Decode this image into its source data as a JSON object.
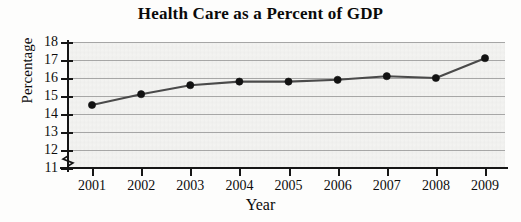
{
  "chart_data": {
    "type": "line",
    "title": "Health Care as a Percent of GDP",
    "xlabel": "Year",
    "ylabel": "Percentage",
    "categories": [
      "2001",
      "2002",
      "2003",
      "2004",
      "2005",
      "2006",
      "2007",
      "2008",
      "2009"
    ],
    "values": [
      14.5,
      15.1,
      15.6,
      15.8,
      15.8,
      15.9,
      16.1,
      16.0,
      17.1
    ],
    "x": [
      2001,
      2002,
      2003,
      2004,
      2005,
      2006,
      2007,
      2008,
      2009
    ],
    "ylim": [
      11,
      18
    ],
    "y_ticks": [
      18,
      17,
      16,
      15,
      14,
      13,
      12,
      11
    ],
    "y_axis_break": true,
    "grid": true,
    "legend": "none",
    "series": [
      {
        "name": "Health care percent of GDP",
        "values": [
          14.5,
          15.1,
          15.6,
          15.8,
          15.8,
          15.9,
          16.1,
          16.0,
          17.1
        ]
      }
    ],
    "colors": {
      "line": "#4a4a4a",
      "marker": "#121212",
      "gridline": "#8d8d8d",
      "axis": "#161616",
      "plot_background": "#f4f4f2"
    }
  }
}
